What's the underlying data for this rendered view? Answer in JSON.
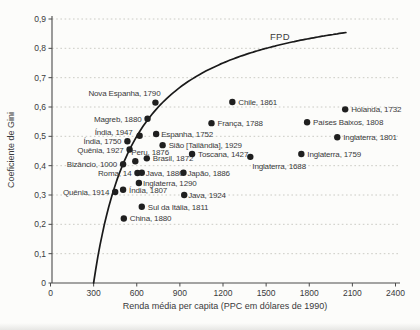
{
  "figure": {
    "background": "#fcfcfa",
    "text_color": "#3a3a3a",
    "dot_color": "#1f1f1f",
    "curve_color": "#1a1a1a",
    "grid_color": "#c6c6c0",
    "axis_color": "#4a4a4a"
  },
  "chart_data": {
    "type": "scatter",
    "title": "",
    "xlabel": "Renda média per capita (PPC em dólares de 1990)",
    "ylabel": "Coeficiente de Gini",
    "xlim": [
      0,
      2400
    ],
    "ylim": [
      0,
      0.9
    ],
    "grid": "horizontal-dotted",
    "legend_position": "none",
    "x_ticks": [
      {
        "v": 0,
        "label": "0"
      },
      {
        "v": 300,
        "label": "300"
      },
      {
        "v": 600,
        "label": "600"
      },
      {
        "v": 900,
        "label": "900"
      },
      {
        "v": 1200,
        "label": "1200"
      },
      {
        "v": 1500,
        "label": "1500"
      },
      {
        "v": 1800,
        "label": "1800"
      },
      {
        "v": 2100,
        "label": "2100"
      },
      {
        "v": 2400,
        "label": "2400"
      }
    ],
    "y_ticks": [
      {
        "v": 0,
        "label": "0"
      },
      {
        "v": 0.1,
        "label": "0,1"
      },
      {
        "v": 0.2,
        "label": "0,2"
      },
      {
        "v": 0.3,
        "label": "0,3"
      },
      {
        "v": 0.4,
        "label": "0,4"
      },
      {
        "v": 0.5,
        "label": "0,5"
      },
      {
        "v": 0.6,
        "label": "0,6"
      },
      {
        "v": 0.7,
        "label": "0,7"
      },
      {
        "v": 0.8,
        "label": "0,8"
      },
      {
        "v": 0.9,
        "label": "0,9"
      }
    ],
    "curve": {
      "label": "FPD",
      "description": "G = 1 - subsistence/x",
      "subsistence": 300,
      "x_start": 300,
      "x_end": 2055
    },
    "points": [
      {
        "label": "Nova Espanha, 1790",
        "x": 730,
        "gini": 0.615,
        "anchor": "end",
        "dx": 5,
        "dy": -7
      },
      {
        "label": "Magreb, 1880",
        "x": 675,
        "gini": 0.56,
        "anchor": "end",
        "dx": -6,
        "dy": 3
      },
      {
        "label": "Índia, 1947",
        "x": 620,
        "gini": 0.502,
        "anchor": "end",
        "dx": -7,
        "dy": -1
      },
      {
        "label": "Índia, 1750",
        "x": 535,
        "gini": 0.483,
        "anchor": "end",
        "dx": -6,
        "dy": 3
      },
      {
        "label": "Quênia, 1927",
        "x": 550,
        "gini": 0.455,
        "anchor": "end",
        "dx": -6,
        "dy": 3
      },
      {
        "label": "Bizâncio, 1000",
        "x": 505,
        "gini": 0.405,
        "anchor": "end",
        "dx": -6,
        "dy": 3
      },
      {
        "label": "Roma, 14",
        "x": 605,
        "gini": 0.375,
        "anchor": "end",
        "dx": -6,
        "dy": 3
      },
      {
        "label": "Quênia, 1914",
        "x": 450,
        "gini": 0.31,
        "anchor": "end",
        "dx": -6,
        "dy": 3
      },
      {
        "label": "Peru, 1876",
        "x": 590,
        "gini": 0.415,
        "anchor": "start",
        "dx": -4,
        "dy": -6
      },
      {
        "label": "Brasil, 1872",
        "x": 670,
        "gini": 0.425,
        "anchor": "start",
        "dx": 6,
        "dy": 3
      },
      {
        "label": "Java, 1880",
        "x": 635,
        "gini": 0.376,
        "anchor": "start",
        "dx": 4,
        "dy": 3
      },
      {
        "label": "Japão, 1886",
        "x": 925,
        "gini": 0.376,
        "anchor": "start",
        "dx": 4,
        "dy": 3
      },
      {
        "label": "Inglaterra, 1290",
        "x": 615,
        "gini": 0.341,
        "anchor": "start",
        "dx": 4,
        "dy": 3
      },
      {
        "label": "Índia, 1807",
        "x": 505,
        "gini": 0.318,
        "anchor": "start",
        "dx": 6,
        "dy": 3
      },
      {
        "label": "Java, 1924",
        "x": 930,
        "gini": 0.3,
        "anchor": "start",
        "dx": 4,
        "dy": 3
      },
      {
        "label": "Sul da Itália, 1811",
        "x": 635,
        "gini": 0.26,
        "anchor": "start",
        "dx": 6,
        "dy": 3
      },
      {
        "label": "China, 1880",
        "x": 510,
        "gini": 0.22,
        "anchor": "start",
        "dx": 6,
        "dy": 3
      },
      {
        "label": "Espanha, 1752",
        "x": 735,
        "gini": 0.508,
        "anchor": "start",
        "dx": 5,
        "dy": 3
      },
      {
        "label": "Sião [Tailândia], 1929",
        "x": 780,
        "gini": 0.47,
        "anchor": "start",
        "dx": 6,
        "dy": 3
      },
      {
        "label": "Toscana, 1427",
        "x": 985,
        "gini": 0.44,
        "anchor": "start",
        "dx": 6,
        "dy": 3
      },
      {
        "label": "França, 1788",
        "x": 1120,
        "gini": 0.545,
        "anchor": "start",
        "dx": 6,
        "dy": 3
      },
      {
        "label": "Chile, 1861",
        "x": 1265,
        "gini": 0.617,
        "anchor": "start",
        "dx": 6,
        "dy": 3
      },
      {
        "label": "Inglaterra, 1688",
        "x": 1390,
        "gini": 0.43,
        "anchor": "start",
        "dx": 2,
        "dy": 12
      },
      {
        "label": "Inglaterra, 1759",
        "x": 1745,
        "gini": 0.44,
        "anchor": "start",
        "dx": 6,
        "dy": 3
      },
      {
        "label": "Países Baixos, 1808",
        "x": 1785,
        "gini": 0.548,
        "anchor": "start",
        "dx": 6,
        "dy": 3
      },
      {
        "label": "Inglaterra, 1801",
        "x": 1995,
        "gini": 0.497,
        "anchor": "start",
        "dx": 6,
        "dy": 3
      },
      {
        "label": "Holanda, 1732",
        "x": 2050,
        "gini": 0.592,
        "anchor": "start",
        "dx": 6,
        "dy": 3
      }
    ]
  }
}
